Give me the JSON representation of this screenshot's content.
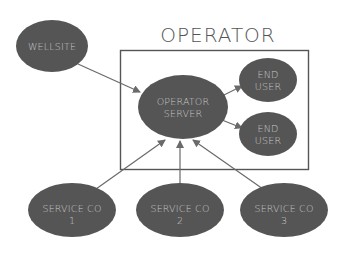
{
  "diagram": {
    "title": "OPERATOR",
    "colors": {
      "node_fill": "#555555",
      "node_text": "#c9c9c9",
      "edge": "#6a6a6a",
      "box_stroke": "#555555",
      "title": "#555555",
      "background": "#ffffff"
    },
    "nodes": {
      "wellsite": {
        "label": "WELLSITE"
      },
      "operator_server": {
        "line1": "OPERATOR",
        "line2": "SERVER"
      },
      "end_user_1": {
        "line1": "END",
        "line2": "USER"
      },
      "end_user_2": {
        "line1": "END",
        "line2": "USER"
      },
      "service_co_1": {
        "line1": "SERVICE CO",
        "line2": "1"
      },
      "service_co_2": {
        "line1": "SERVICE CO",
        "line2": "2"
      },
      "service_co_3": {
        "line1": "SERVICE CO",
        "line2": "3"
      }
    },
    "edges": [
      {
        "from": "WELLSITE",
        "to": "OPERATOR SERVER"
      },
      {
        "from": "OPERATOR SERVER",
        "to": "END USER (top)"
      },
      {
        "from": "OPERATOR SERVER",
        "to": "END USER (bottom)"
      },
      {
        "from": "SERVICE CO 1",
        "to": "OPERATOR SERVER"
      },
      {
        "from": "SERVICE CO 2",
        "to": "OPERATOR SERVER"
      },
      {
        "from": "SERVICE CO 3",
        "to": "OPERATOR SERVER"
      }
    ],
    "group": {
      "label": "OPERATOR",
      "contains": [
        "OPERATOR SERVER",
        "END USER",
        "END USER"
      ]
    }
  }
}
